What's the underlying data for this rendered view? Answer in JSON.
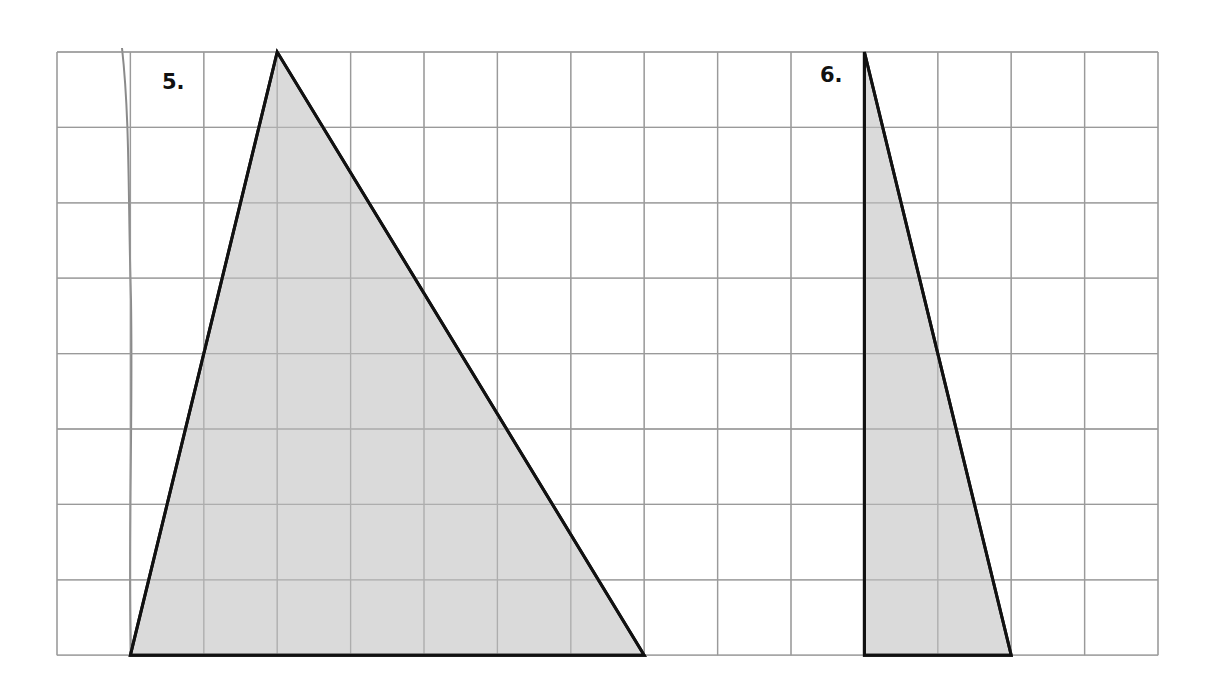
{
  "worksheet": {
    "grid": {
      "columns": 15,
      "rows": 8,
      "origin_x": 57,
      "origin_y": 52,
      "cell_w": 73.4,
      "cell_h": 75.4,
      "line_color": "#9a9a9a"
    },
    "shape_fill": "#d3d3d3",
    "shape_stroke": "#111111",
    "problems": [
      {
        "label": "5.",
        "label_x": 162,
        "label_y": 70,
        "vertices_grid": [
          [
            1,
            8
          ],
          [
            3,
            0
          ],
          [
            8,
            8
          ]
        ],
        "base_units": 7,
        "height_units": 8
      },
      {
        "label": "6.",
        "label_x": 820,
        "label_y": 63,
        "vertices_grid": [
          [
            11,
            8
          ],
          [
            11,
            0
          ],
          [
            13,
            8
          ]
        ],
        "base_units": 2,
        "height_units": 8
      }
    ]
  }
}
